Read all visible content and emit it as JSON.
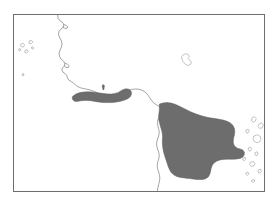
{
  "figure": {
    "type": "distribution-range-map",
    "width": 279,
    "height": 207,
    "background_color": "#ffffff"
  },
  "frame": {
    "x": 13.5,
    "y": 14.5,
    "width": 251,
    "height": 177,
    "stroke_color": "#6e6e6e",
    "stroke_width": 1,
    "fill_color": "#ffffff"
  },
  "style": {
    "ocean_color": "#ffffff",
    "land_fill_color": "#ffffff",
    "coastline_color": "#7d7d7d",
    "coastline_width": 0.7,
    "range_fill_color": "#6d6d6d",
    "range_stroke_color": "#5c5c5c",
    "island_stroke_color": "#9a9a9a"
  },
  "layers": [
    {
      "name": "frame-border",
      "label": "Map frame border"
    },
    {
      "name": "coastline",
      "label": "Coastline"
    },
    {
      "name": "islands",
      "label": "Offshore islands"
    },
    {
      "name": "range-polygons",
      "label": "Shaded distribution range"
    }
  ],
  "coastline_paths": {
    "mainland_west_coast": "M 57.5 14.5 L 58.2 18.4 L 60.1 21.0 L 62.4 22.2 L 63.8 24.6 L 63.2 27.4 L 60.9 29.1 L 58.9 31.6 L 58.6 34.8 L 59.8 37.9 L 61.3 40.6 L 62.0 43.8 L 61.4 47.0 L 60.0 50.1 L 59.1 53.4 L 59.6 56.6 L 61.2 59.2 L 63.4 61.0 L 65.0 63.4 L 64.4 66.0 L 62.6 67.6 L 61.9 70.0 L 63.0 72.2 L 65.1 73.6 L 66.8 75.4 L 67.4 78.0 L 69.0 80.2 L 71.3 81.6 L 73.6 83.0 L 75.4 85.0 L 77.8 86.6 L 80.6 87.8 L 83.6 88.6 L 86.8 89.2 L 90.2 90.0 L 93.6 91.2 L 96.8 92.6 L 100.0 94.0 L 103.4 95.2 L 106.8 96.0 L 110.4 96.4 L 114.0 96.2 L 117.4 95.4 L 120.6 94.2 L 123.6 92.8 L 126.4 91.4 L 129.2 90.2 L 132.2 89.4 L 135.4 89.0 L 138.6 89.2 L 141.6 90.0 L 144.2 91.4 L 146.4 93.2 L 148.2 95.4 L 149.8 97.8 L 151.4 100.2 L 153.2 102.4 L 155.4 104.2 L 157.8 105.6 L 160.2 106.6 L 162.0 108.2 L 162.6 110.6 L 162.0 113.2 L 160.6 115.4 L 159.0 117.4 L 157.8 119.8 L 157.4 122.6 L 157.8 125.6 L 158.6 128.6 L 159.2 131.6 L 159.0 134.6 L 158.2 137.4 L 157.2 140.2 L 156.6 143.2 L 156.8 146.2 L 157.6 149.0 L 158.6 151.8 L 159.2 154.8 L 159.0 157.8 L 158.2 160.6 L 157.4 163.6 L 157.2 166.6 L 157.8 169.6 L 158.8 172.4 L 159.6 175.4 L 159.8 178.6 L 159.4 181.8 L 158.6 184.8 L 157.8 188.0 L 157.4 191.2",
    "upper_coast_detail": "M 63.8 24.6 L 66.2 25.4 L 68.0 27.0 L 67.0 28.4 L 64.6 28.2 L 63.2 27.4",
    "mid_coast_inlet": "M 65.0 63.4 L 67.4 64.2 L 69.2 65.8 L 68.4 67.4 L 66.0 67.4 L 64.4 66.0",
    "bay_notch": "M 160.2 106.6 L 163.4 106.0 L 166.2 106.8 L 167.4 108.8 L 166.0 110.6 L 163.4 111.2 L 162.0 110.0"
  },
  "island_paths": {
    "upper_right_island": "M 183.0 55.0 L 185.6 53.6 L 188.2 54.4 L 189.4 56.6 L 188.0 58.4 L 189.6 60.0 L 191.4 62.0 L 190.6 64.4 L 188.2 65.4 L 185.6 64.6 L 184.0 62.6 L 182.4 60.4 L 181.6 58.0 L 181.8 56.2 Z",
    "left_island_a": "M 21.0 44.0 L 23.4 43.4 L 24.6 45.2 L 23.2 47.0 L 21.0 46.6 L 20.2 45.2 Z",
    "left_island_b": "M 29.0 41.0 L 31.6 40.4 L 32.8 42.2 L 31.2 43.8 L 29.2 43.4 Z",
    "left_island_c": "M 25.0 50.4 L 27.2 49.8 L 28.2 51.6 L 26.6 53.0 L 24.8 52.4 Z",
    "left_island_d": "M 18.6 49.0 L 20.2 48.6 L 20.8 50.2 L 19.2 51.0 Z",
    "left_island_e": "M 31.4 47.2 L 33.0 46.8 L 33.6 48.4 L 32.0 49.2 Z",
    "left_dot_f": "M 22.0 74.0 L 23.6 73.6 L 24.0 75.2 L 22.4 75.8 Z",
    "right_island_chain_1": "M 252.0 118.0 L 254.4 116.6 L 256.2 118.4 L 255.4 121.0 L 253.2 122.2 L 251.4 120.8 Z",
    "right_island_chain_2": "M 259.0 124.0 L 261.8 122.8 L 263.4 125.0 L 262.2 127.8 L 259.6 128.4 L 258.0 126.4 Z",
    "right_island_chain_3": "M 246.0 130.0 L 248.2 129.2 L 249.2 131.4 L 247.8 133.2 L 245.8 132.2 Z",
    "right_island_chain_4": "M 254.0 136.0 L 257.4 134.8 L 260.2 136.4 L 261.0 139.4 L 259.4 142.0 L 256.2 142.6 L 253.8 141.0 L 253.0 138.2 Z",
    "right_island_chain_5": "M 248.4 148.0 L 250.6 147.2 L 251.6 149.4 L 250.2 151.2 L 248.2 150.2 Z",
    "right_island_chain_6": "M 255.0 152.6 L 257.2 151.8 L 258.2 154.0 L 256.8 155.8 L 254.8 154.8 Z",
    "right_island_chain_7": "M 243.0 158.0 L 245.0 157.4 L 245.8 159.2 L 244.4 160.6 L 242.6 159.8 Z",
    "right_island_chain_8": "M 250.6 162.4 L 253.4 161.4 L 255.0 163.6 L 253.6 166.0 L 251.0 166.2 L 249.6 164.4 Z",
    "right_island_chain_9": "M 258.2 170.0 L 260.4 169.2 L 261.4 171.4 L 260.0 173.2 L 258.0 172.2 Z",
    "right_island_chain_10": "M 246.2 172.8 L 248.0 172.2 L 248.8 174.0 L 247.4 175.2 L 245.8 174.4 Z",
    "bottom_right_bits": "M 252.0 180.0 L 254.0 179.4 L 254.8 181.2 L 253.2 182.4 L 251.6 181.6 Z"
  },
  "range_polygons": [
    {
      "name": "eastern-range-polygon",
      "path": "M 159.4 104.0 L 163.0 103.0 L 167.0 102.6 L 171.0 103.0 L 175.0 104.2 L 179.0 106.0 L 183.0 108.0 L 187.0 110.0 L 191.0 112.0 L 195.0 113.6 L 199.0 115.0 L 203.0 116.2 L 207.0 117.2 L 211.0 118.0 L 215.0 118.6 L 219.0 119.2 L 223.0 120.0 L 227.0 121.2 L 230.4 123.0 L 233.0 125.4 L 234.4 128.4 L 234.8 131.6 L 234.4 134.8 L 233.6 138.0 L 233.2 141.2 L 233.6 144.2 L 235.0 146.6 L 237.4 148.2 L 240.2 149.0 L 242.8 150.0 L 244.4 152.2 L 244.2 155.0 L 242.6 157.2 L 240.0 158.4 L 236.8 159.0 L 233.4 159.2 L 230.0 159.2 L 226.6 159.2 L 223.2 159.4 L 219.8 160.0 L 216.6 161.2 L 214.0 163.0 L 212.2 165.4 L 211.2 168.2 L 210.6 171.2 L 209.8 174.2 L 208.4 176.8 L 206.0 178.6 L 203.0 179.4 L 199.8 179.6 L 196.4 179.4 L 193.0 179.0 L 189.6 178.6 L 186.2 178.2 L 182.8 177.8 L 179.4 177.2 L 176.2 176.2 L 173.4 174.6 L 171.2 172.4 L 169.6 169.8 L 168.4 167.0 L 167.4 164.0 L 166.4 161.0 L 165.4 158.0 L 164.4 155.0 L 163.6 152.0 L 163.0 149.0 L 162.6 146.0 L 162.4 143.0 L 162.4 140.0 L 162.6 137.0 L 162.4 134.0 L 161.8 131.0 L 161.0 128.2 L 160.2 125.4 L 159.4 122.6 L 158.8 119.8 L 158.6 117.0 L 158.8 114.2 L 159.2 111.4 L 159.4 108.6 Z"
    },
    {
      "name": "central-range-blob",
      "path": "M 73.0 96.0 L 76.4 93.8 L 80.0 92.6 L 83.8 92.0 L 87.8 91.8 L 91.8 92.0 L 95.8 92.4 L 99.8 93.0 L 103.8 93.6 L 107.8 94.0 L 111.6 94.0 L 115.2 93.4 L 118.4 92.4 L 121.0 90.8 L 123.4 89.4 L 126.2 88.8 L 129.0 89.2 L 131.0 91.0 L 131.6 93.6 L 130.6 96.2 L 128.6 98.2 L 126.0 99.6 L 123.0 100.6 L 119.8 101.4 L 116.4 102.0 L 113.0 102.4 L 109.4 102.6 L 105.8 102.6 L 102.2 102.4 L 98.6 102.0 L 95.0 101.4 L 91.4 100.8 L 87.8 100.4 L 84.2 100.4 L 80.6 100.8 L 77.2 101.4 L 74.4 101.2 L 72.6 99.4 L 72.2 97.4 Z"
    },
    {
      "name": "small-marker-speck",
      "path": "M 102.2 85.4 L 103.4 84.6 L 104.4 85.6 L 104.2 87.6 L 103.8 89.8 L 103.0 89.8 L 102.4 87.6 Z"
    }
  ]
}
